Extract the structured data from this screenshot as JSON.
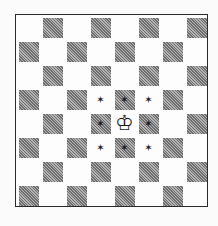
{
  "diagram": {
    "type": "chessboard",
    "size": 8,
    "top_left_square": "light",
    "colors": {
      "light": "#fdfdfd",
      "dark": "#8c8c8c",
      "border": "#2a2a2a",
      "marker": "#151515"
    },
    "pieces": [
      {
        "square": "e4",
        "row": 4,
        "col": 4,
        "piece": "white-king",
        "glyph": "♔"
      }
    ],
    "markers": [
      {
        "square": "d5",
        "row": 3,
        "col": 3,
        "glyph": "✶"
      },
      {
        "square": "e5",
        "row": 3,
        "col": 4,
        "glyph": "✶"
      },
      {
        "square": "f5",
        "row": 3,
        "col": 5,
        "glyph": "✶"
      },
      {
        "square": "d4",
        "row": 4,
        "col": 3,
        "glyph": "✶"
      },
      {
        "square": "f4",
        "row": 4,
        "col": 5,
        "glyph": "✶"
      },
      {
        "square": "d3",
        "row": 5,
        "col": 3,
        "glyph": "✶"
      },
      {
        "square": "e3",
        "row": 5,
        "col": 4,
        "glyph": "✶"
      },
      {
        "square": "f3",
        "row": 5,
        "col": 5,
        "glyph": "✶"
      }
    ]
  }
}
